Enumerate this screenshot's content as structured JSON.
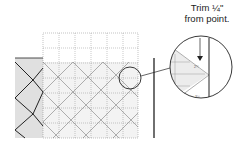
{
  "callout": {
    "line1": "Trim ¼\"",
    "line2": "from point."
  },
  "ruler_labels": {
    "zoom_measure": "2¼",
    "zoom_bottom": "3½"
  },
  "colors": {
    "block_fill": "#e2e2e2",
    "light_fill": "#f2f2f2",
    "line_dark": "#222222",
    "grid_line": "#888888"
  }
}
